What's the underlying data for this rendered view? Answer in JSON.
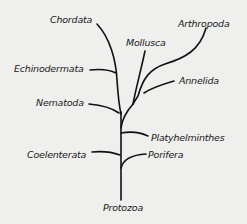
{
  "diagram": {
    "type": "phylogenetic-tree",
    "colors": {
      "background": "#efefed",
      "line": "#111111",
      "text": "#1a1a1a"
    },
    "root": "Protozoa",
    "labels": {
      "chordata": "Chordata",
      "arthropoda": "Arthropoda",
      "mollusca": "Mollusca",
      "echinodermata": "Echinodermata",
      "annelida": "Annelida",
      "nematoda": "Nematoda",
      "platyhelminthes": "Platyhelminthes",
      "coelenterata": "Coelenterata",
      "porifera": "Porifera",
      "protozoa": "Protozoa"
    }
  }
}
